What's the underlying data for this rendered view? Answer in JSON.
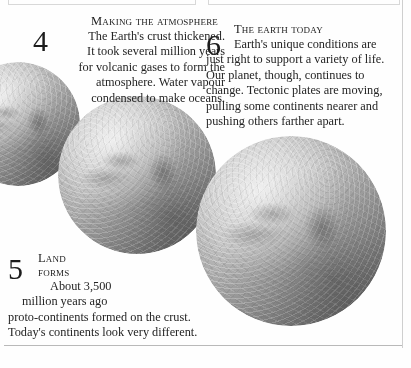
{
  "page": {
    "background_color": "#fefefe",
    "text_color": "#242424"
  },
  "sections": [
    {
      "number": "4",
      "heading": "Making the atmosphere",
      "lines": [
        "The Earth's crust thickened.",
        "It took several million years",
        "for volcanic gases to form the",
        "atmosphere. Water vapour",
        "condensed to make oceans."
      ],
      "align": "right"
    },
    {
      "number": "5",
      "heading_line1": "Land",
      "heading_line2": "forms",
      "lines": [
        "About 3,500",
        "million years ago",
        "proto-continents formed on the crust.",
        "Today's continents look very different."
      ],
      "align": "left"
    },
    {
      "number": "6",
      "heading": "The earth today",
      "lines": [
        "Earth's unique conditions are",
        "just right to support a variety of life.",
        "Our planet, though, continues to",
        "change. Tectonic plates are moving,",
        "pulling some continents nearer and",
        "pushing others farther apart."
      ],
      "align": "left"
    }
  ],
  "figures": [
    {
      "name": "globe-left",
      "caption": "Earth globe photograph, partially cropped at left edge"
    },
    {
      "name": "globe-mid",
      "caption": "Earth globe photograph, centre"
    },
    {
      "name": "globe-right",
      "caption": "Earth globe photograph, largest, right"
    }
  ],
  "rules": {
    "bottom_rule_color": "#b9b9b9",
    "right_rule_color": "#cfcfcf"
  }
}
